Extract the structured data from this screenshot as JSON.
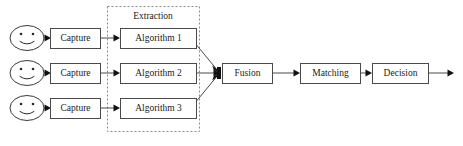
{
  "diagram": {
    "type": "flow-diagram",
    "canvas": {
      "width": 463,
      "height": 146,
      "background": "#ffffff"
    },
    "colors": {
      "box_stroke": "#4a4a4a",
      "box_fill": "#ffffff",
      "group_stroke": "#8a8a8a",
      "line": "#4a4a4a",
      "arrow": "#111111",
      "text": "#1a1a1a"
    },
    "group": {
      "label": "Extraction",
      "style": "dashed",
      "x": 107,
      "y": 6,
      "width": 92,
      "height": 125,
      "label_x": 153,
      "label_y": 16
    },
    "rows": [
      {
        "y_center": 38,
        "source": {
          "name": "face-icon-1",
          "cx": 27,
          "cy": 38,
          "rx": 17,
          "ry": 13
        },
        "capture": {
          "label": "Capture",
          "x": 50,
          "y": 28,
          "width": 50,
          "height": 20
        },
        "algorithm": {
          "label": "Algorithm 1",
          "x": 120,
          "y": 28,
          "width": 76,
          "height": 20
        }
      },
      {
        "y_center": 73,
        "source": {
          "name": "face-icon-2",
          "cx": 27,
          "cy": 73,
          "rx": 17,
          "ry": 13
        },
        "capture": {
          "label": "Capture",
          "x": 50,
          "y": 63,
          "width": 50,
          "height": 20
        },
        "algorithm": {
          "label": "Algorithm 2",
          "x": 120,
          "y": 63,
          "width": 76,
          "height": 20
        }
      },
      {
        "y_center": 108,
        "source": {
          "name": "face-icon-3",
          "cx": 27,
          "cy": 108,
          "rx": 17,
          "ry": 13
        },
        "capture": {
          "label": "Capture",
          "x": 50,
          "y": 98,
          "width": 50,
          "height": 20
        },
        "algorithm": {
          "label": "Algorithm 3",
          "x": 120,
          "y": 98,
          "width": 76,
          "height": 20
        }
      }
    ],
    "stages": [
      {
        "name": "fusion",
        "label": "Fusion",
        "x": 222,
        "y": 63,
        "width": 50,
        "height": 20
      },
      {
        "name": "matching",
        "label": "Matching",
        "x": 300,
        "y": 63,
        "width": 60,
        "height": 20
      },
      {
        "name": "decision",
        "label": "Decision",
        "x": 372,
        "y": 63,
        "width": 56,
        "height": 20
      }
    ],
    "fusion_junction": {
      "x": 219,
      "y": 73
    },
    "output_arrow": {
      "from_x": 428,
      "to_x": 454,
      "y": 73
    },
    "edges": [
      {
        "name": "face1-to-capture1",
        "from": [
          44,
          38
        ],
        "to": [
          50,
          38
        ]
      },
      {
        "name": "capture1-to-algorithm1",
        "from": [
          100,
          38
        ],
        "to": [
          120,
          38
        ]
      },
      {
        "name": "algorithm1-to-fusion",
        "from": [
          196,
          45
        ],
        "to": [
          219,
          70
        ]
      },
      {
        "name": "face2-to-capture2",
        "from": [
          44,
          73
        ],
        "to": [
          50,
          73
        ]
      },
      {
        "name": "capture2-to-algorithm2",
        "from": [
          100,
          73
        ],
        "to": [
          120,
          73
        ]
      },
      {
        "name": "algorithm2-to-fusion",
        "from": [
          196,
          73
        ],
        "to": [
          219,
          73
        ]
      },
      {
        "name": "face3-to-capture3",
        "from": [
          44,
          108
        ],
        "to": [
          50,
          108
        ]
      },
      {
        "name": "capture3-to-algorithm3",
        "from": [
          100,
          108
        ],
        "to": [
          120,
          108
        ]
      },
      {
        "name": "algorithm3-to-fusion",
        "from": [
          196,
          101
        ],
        "to": [
          219,
          77
        ]
      },
      {
        "name": "fusion-to-matching",
        "from": [
          272,
          73
        ],
        "to": [
          300,
          73
        ]
      },
      {
        "name": "matching-to-decision",
        "from": [
          360,
          73
        ],
        "to": [
          372,
          73
        ]
      },
      {
        "name": "decision-to-output",
        "from": [
          428,
          73
        ],
        "to": [
          454,
          73
        ]
      }
    ]
  }
}
